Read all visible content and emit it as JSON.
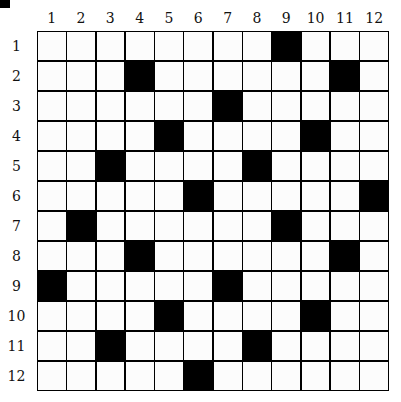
{
  "puzzle": {
    "rows": 12,
    "cols": 12,
    "col_labels": [
      "1",
      "2",
      "3",
      "4",
      "5",
      "6",
      "7",
      "8",
      "9",
      "10",
      "11",
      "12"
    ],
    "row_labels": [
      "1",
      "2",
      "3",
      "4",
      "5",
      "6",
      "7",
      "8",
      "9",
      "10",
      "11",
      "12"
    ],
    "black_cells": [
      [
        1,
        9
      ],
      [
        2,
        4
      ],
      [
        2,
        11
      ],
      [
        3,
        7
      ],
      [
        4,
        5
      ],
      [
        4,
        10
      ],
      [
        5,
        3
      ],
      [
        5,
        8
      ],
      [
        6,
        6
      ],
      [
        6,
        12
      ],
      [
        7,
        2
      ],
      [
        7,
        9
      ],
      [
        8,
        4
      ],
      [
        8,
        11
      ],
      [
        9,
        1
      ],
      [
        9,
        7
      ],
      [
        10,
        5
      ],
      [
        10,
        10
      ],
      [
        11,
        3
      ],
      [
        11,
        8
      ],
      [
        12,
        6
      ]
    ],
    "colors": {
      "black": "#000000",
      "white": "#fcfcfc"
    }
  }
}
